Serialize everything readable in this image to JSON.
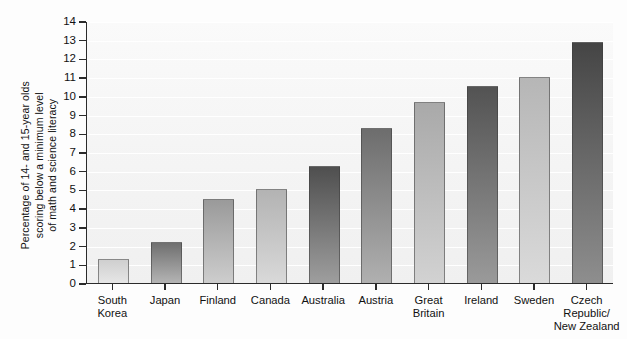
{
  "chart_data": {
    "type": "bar",
    "title": "",
    "subtitle": "",
    "xlabel": "",
    "ylabel": "Percentage of 14- and 15-year olds\nscoring below a minimum level\nof math and science literacy",
    "categories": [
      "South\nKorea",
      "Japan",
      "Finland",
      "Canada",
      "Australia",
      "Austria",
      "Great\nBritain",
      "Ireland",
      "Sweden",
      "Czech\nRepublic/\nNew Zealand"
    ],
    "values": [
      1.3,
      2.2,
      4.5,
      5.05,
      6.25,
      8.3,
      9.65,
      10.55,
      11.0,
      12.9
    ],
    "ylim": [
      0,
      14
    ],
    "ytick_labels": [
      "0",
      "1",
      "2",
      "3",
      "4",
      "5",
      "6",
      "7",
      "8",
      "9",
      "10",
      "11",
      "12",
      "13",
      "14"
    ],
    "ytick_values": [
      0,
      1,
      2,
      3,
      4,
      5,
      6,
      7,
      8,
      9,
      10,
      11,
      12,
      13,
      14
    ],
    "grid": true,
    "grid_color": "#ffffff",
    "legend": "none",
    "bar_colors": [
      {
        "top": "#cfcfcf",
        "bottom": "#e6e6e6"
      },
      {
        "top": "#6f6f6f",
        "bottom": "#b4b4b4"
      },
      {
        "top": "#9a9a9a",
        "bottom": "#cdcdcd"
      },
      {
        "top": "#b3b3b3",
        "bottom": "#d9d9d9"
      },
      {
        "top": "#4f4f4f",
        "bottom": "#9e9e9e"
      },
      {
        "top": "#6d6d6d",
        "bottom": "#b0b0b0"
      },
      {
        "top": "#a9a9a9",
        "bottom": "#d2d2d2"
      },
      {
        "top": "#535353",
        "bottom": "#9a9a9a"
      },
      {
        "top": "#b6b6b6",
        "bottom": "#dadada"
      },
      {
        "top": "#454545",
        "bottom": "#8e8e8e"
      }
    ],
    "axis_color": "#2b2b2b",
    "plot_background": "#f4f4f4"
  }
}
